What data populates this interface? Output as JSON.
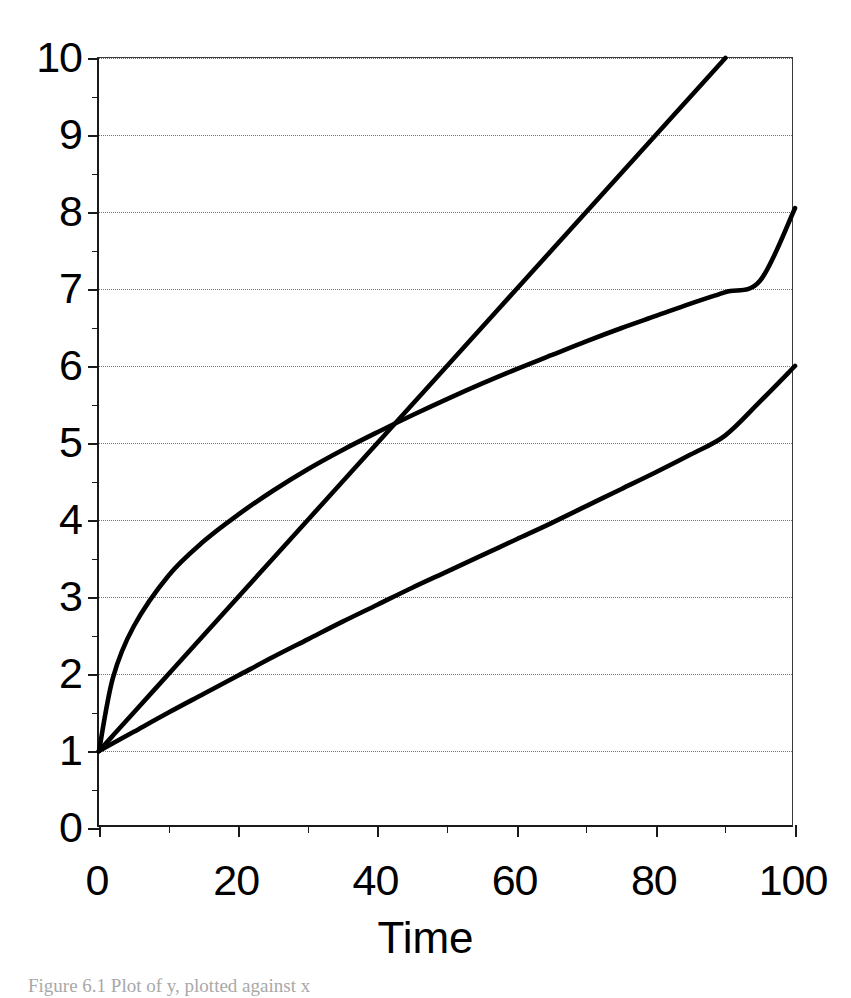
{
  "figure": {
    "caption": "Figure 6.1   Plot of y, plotted against x",
    "background_color": "#ffffff",
    "line_color": "#000000",
    "grid_color": "#6d6d6d",
    "axis_color": "#1a1a1a"
  },
  "axes": {
    "x_title": "Time",
    "y_title": "",
    "x_tick_labels": [
      "0",
      "20",
      "40",
      "60",
      "80",
      "100"
    ],
    "x_tick_values": [
      0,
      20,
      40,
      60,
      80,
      100
    ],
    "x_minor_values": [
      10,
      30,
      50,
      70,
      90
    ],
    "y_tick_labels": [
      "0",
      "1",
      "2",
      "3",
      "4",
      "5",
      "6",
      "7",
      "8",
      "9",
      "10"
    ],
    "y_tick_values": [
      0,
      1,
      2,
      3,
      4,
      5,
      6,
      7,
      8,
      9,
      10
    ],
    "y_minor_values": [
      0.5,
      1.5,
      2.5,
      3.5,
      4.5,
      5.5,
      6.5,
      7.5,
      8.5,
      9.5
    ],
    "gridline_values": [
      1,
      2,
      3,
      4,
      5,
      6,
      7,
      8,
      9,
      10
    ]
  },
  "chart_data": {
    "type": "line",
    "title": "",
    "xlabel": "Time",
    "ylabel": "",
    "xlim": [
      0,
      100
    ],
    "ylim": [
      0,
      10
    ],
    "grid": "horizontal-dotted",
    "legend": "none",
    "x": [
      0,
      2,
      5,
      10,
      15,
      20,
      25,
      30,
      35,
      40,
      45,
      50,
      55,
      60,
      65,
      70,
      75,
      80,
      85,
      90,
      95,
      100
    ],
    "series": [
      {
        "name": "concave-upper-curve",
        "shape": "logarithmic",
        "values": [
          1.0,
          1.95,
          2.62,
          3.28,
          3.72,
          4.07,
          4.38,
          4.66,
          4.91,
          5.14,
          5.36,
          5.57,
          5.77,
          5.96,
          6.14,
          6.32,
          6.49,
          6.65,
          6.81,
          6.96,
          7.11,
          8.05
        ]
      },
      {
        "name": "steep-straight-line",
        "shape": "linear",
        "values": [
          1.0,
          1.2,
          1.5,
          2.0,
          2.5,
          3.0,
          3.5,
          4.0,
          4.5,
          5.0,
          5.5,
          6.0,
          6.5,
          7.0,
          7.5,
          8.0,
          8.5,
          9.0,
          9.5,
          10.0,
          null,
          null
        ]
      },
      {
        "name": "shallow-lower-curve",
        "shape": "near-linear-slightly-concave",
        "values": [
          1.0,
          1.1,
          1.25,
          1.5,
          1.74,
          1.98,
          2.22,
          2.45,
          2.68,
          2.9,
          3.12,
          3.33,
          3.54,
          3.75,
          3.96,
          4.18,
          4.4,
          4.62,
          4.85,
          5.1,
          5.54,
          6.0
        ]
      }
    ],
    "annotations": [
      {
        "label": "crossing point of steep line and upper curve",
        "x": 50,
        "y": 6.0
      },
      {
        "label": "all curves originate at",
        "x": 0,
        "y": 1.0
      },
      {
        "label": "steep line exits top of plot at",
        "x": 90,
        "y": 10.0
      },
      {
        "label": "upper curve endpoint",
        "x": 100,
        "y": 8.05
      },
      {
        "label": "lower curve endpoint",
        "x": 100,
        "y": 6.0
      }
    ]
  }
}
